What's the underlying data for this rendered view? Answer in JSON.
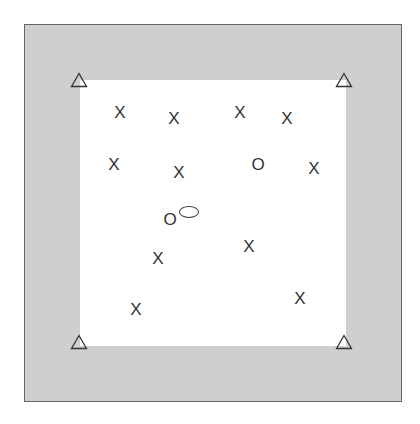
{
  "diagram": {
    "canvas": {
      "width": 420,
      "height": 424,
      "background": "#ffffff"
    },
    "outer_square": {
      "x": 24,
      "y": 24,
      "size": 378,
      "fill": "#cfcfcf",
      "border": "#666666"
    },
    "inner_square": {
      "x": 80,
      "y": 80,
      "size": 266,
      "fill": "#ffffff"
    },
    "stroke_color": "#333333",
    "triangles": [
      {
        "x": 79,
        "y": 82
      },
      {
        "x": 344,
        "y": 82
      },
      {
        "x": 79,
        "y": 344
      },
      {
        "x": 344,
        "y": 344
      }
    ],
    "x_marks": [
      {
        "label": "X",
        "x": 120,
        "y": 112
      },
      {
        "label": "X",
        "x": 174,
        "y": 118
      },
      {
        "label": "X",
        "x": 240,
        "y": 112
      },
      {
        "label": "X",
        "x": 287,
        "y": 118
      },
      {
        "label": "X",
        "x": 114,
        "y": 164
      },
      {
        "label": "X",
        "x": 179,
        "y": 172
      },
      {
        "label": "X",
        "x": 314,
        "y": 168
      },
      {
        "label": "X",
        "x": 249,
        "y": 246
      },
      {
        "label": "X",
        "x": 158,
        "y": 258
      },
      {
        "label": "X",
        "x": 136,
        "y": 309
      },
      {
        "label": "X",
        "x": 300,
        "y": 298
      }
    ],
    "o_marks": [
      {
        "label": "O",
        "x": 258,
        "y": 164
      },
      {
        "label": "O",
        "x": 170,
        "y": 219
      }
    ],
    "ellipse": {
      "x": 189,
      "y": 212,
      "width": 20,
      "height": 12
    }
  }
}
